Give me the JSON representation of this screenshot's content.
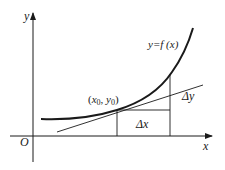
{
  "diagram": {
    "type": "derivative-tangent-illustration",
    "labels": {
      "y_axis": "y",
      "x_axis": "x",
      "origin": "O",
      "function": "y=f (x)",
      "point": "(x0, y0)",
      "point_x": "x",
      "point_x_sub": "0",
      "point_sep": ", ",
      "point_y": "y",
      "point_y_sub": "0",
      "point_open": "(",
      "point_close": ")",
      "delta_x": "Δx",
      "delta_y": "Δy"
    },
    "elements": [
      "y-axis with arrow",
      "x-axis with arrow",
      "curve y=f(x)",
      "tangent line at (x0, y0)",
      "Δx horizontal segment",
      "Δy vertical segment"
    ],
    "colors": {
      "stroke": "#1a1a1a",
      "background": "#ffffff"
    }
  }
}
